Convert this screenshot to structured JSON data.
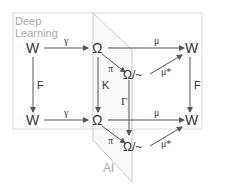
{
  "regions": {
    "deep_learning": {
      "label_line1": "Deep",
      "label_line2": "Learning"
    },
    "ai": {
      "label": "AI"
    }
  },
  "nodes": {
    "w_top_left": "W",
    "omega_top": "Ω",
    "omega_quot_top": "Ω/~",
    "w_top_right": "W",
    "w_bottom_left": "W",
    "omega_bottom": "Ω",
    "omega_quot_bottom": "Ω/~",
    "w_bottom_right": "W"
  },
  "edges": {
    "gamma_top": "γ",
    "mu_top": "μ",
    "pi_top": "π",
    "mu_star_top": "μ*",
    "f_left": "F",
    "k_mid": "K",
    "gamma_cap_mid": "Γ",
    "f_right": "F",
    "gamma_bottom": "γ",
    "mu_bottom": "μ",
    "pi_bottom": "π",
    "mu_star_bottom": "μ*"
  },
  "colors": {
    "arrow": "#555555",
    "region_border": "#d9d9d9",
    "region_text": "#aaaaaa",
    "text": "#333333"
  }
}
